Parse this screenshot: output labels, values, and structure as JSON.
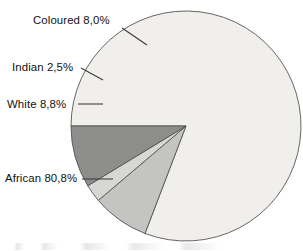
{
  "chart_data": {
    "type": "pie",
    "title": "",
    "subtitle": "",
    "xlabel": "",
    "ylabel": "",
    "legend_position": "none",
    "grid": false,
    "decimal_separator": ",",
    "value_suffix": "%",
    "total": 100.1,
    "categories": [
      "African",
      "White",
      "Indian",
      "Coloured"
    ],
    "values": [
      80.8,
      8.8,
      2.5,
      8.0
    ],
    "slices": [
      {
        "name": "african-slice",
        "label": "African",
        "value": 80.8,
        "value_text": "80,8%",
        "label_text": "African 80,8%",
        "color": "#f0efec",
        "start_angle": 180.0,
        "end_angle": 470.88
      },
      {
        "name": "coloured-slice",
        "label": "Coloured",
        "value": 8.0,
        "value_text": "8,0%",
        "label_text": "Coloured 8,0%",
        "color": "#c4c4c2",
        "start_angle": 470.88,
        "end_angle": 499.68
      },
      {
        "name": "indian-slice",
        "label": "Indian",
        "value": 2.5,
        "value_text": "2,5%",
        "label_text": "Indian 2,5%",
        "color": "#d7d7d5",
        "start_angle": 499.68,
        "end_angle": 508.68
      },
      {
        "name": "white-slice",
        "label": "White",
        "value": 8.8,
        "value_text": "8,8%",
        "label_text": "White 8,8%",
        "color": "#8d8d8b",
        "start_angle": 508.68,
        "end_angle": 540.0
      }
    ],
    "geometry": {
      "center_x": 186,
      "center_y": 126,
      "radius": 115
    },
    "labels": [
      {
        "key": "coloured",
        "text": "Coloured 8,0%",
        "text_x": 33,
        "text_y": 24,
        "anchor": "start",
        "leader": "M 122,28 L 147,45"
      },
      {
        "key": "indian",
        "text": "Indian 2,5%",
        "text_x": 12,
        "text_y": 71,
        "anchor": "start",
        "leader": "M 81,68 L 103,80"
      },
      {
        "key": "white",
        "text": "White 8,8%",
        "text_x": 7,
        "text_y": 108,
        "anchor": "start",
        "leader": "M 78,104 L 103,104"
      },
      {
        "key": "african",
        "text": "African 80,8%",
        "text_x": 5,
        "text_y": 182,
        "anchor": "start",
        "leader": "M 82,179 L 113,179"
      }
    ]
  },
  "colors": {
    "background": "#ffffff",
    "slice_outline": "#555555",
    "leader_line": "#3a3a3a",
    "text": "#121212"
  }
}
